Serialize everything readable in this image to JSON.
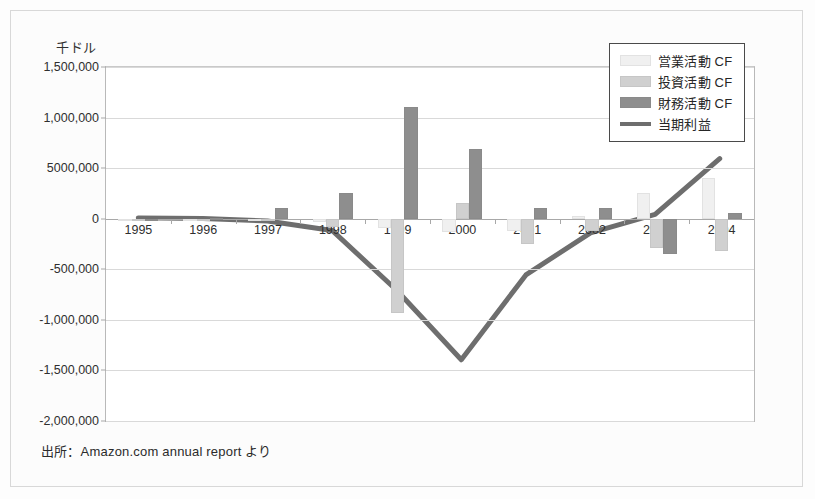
{
  "figure": {
    "unit_label": "千ドル",
    "source_note": "出所：Amazon.com annual report より"
  },
  "legend": {
    "items": [
      {
        "label": "営業活動 CF",
        "swatch": "op",
        "color": "#f0f0f0"
      },
      {
        "label": "投資活動 CF",
        "swatch": "inv",
        "color": "#d0d0d0"
      },
      {
        "label": "財務活動 CF",
        "swatch": "fin",
        "color": "#8e8e8e"
      },
      {
        "label": "当期利益",
        "swatch": "line",
        "color": "#6e6e6e"
      }
    ]
  },
  "chart_data": {
    "type": "bar",
    "title": "",
    "subtitle": "",
    "xlabel": "",
    "ylabel": "千ドル",
    "unit": "千ドル",
    "grid": true,
    "legend_position": "top-right",
    "categories": [
      "1995",
      "1996",
      "1997",
      "1998",
      "1999",
      "2000",
      "2001",
      "2002",
      "2003",
      "2004"
    ],
    "ylim": [
      -2000000,
      1500000
    ],
    "yticks": [
      1500000,
      1000000,
      500000,
      0,
      -500000,
      -1000000,
      -1500000,
      -2000000
    ],
    "ytick_labels": [
      "1,500,000",
      "1,000,000",
      "5000,000",
      "0",
      "-500,000",
      "-1,000,000",
      "-1,500,000",
      "-2,000,000"
    ],
    "series": [
      {
        "name": "営業活動 CF",
        "kind": "bar",
        "color": "#f0f0f0",
        "values": [
          0,
          -1000,
          -10000,
          -30000,
          -90000,
          -130000,
          -120000,
          30000,
          250000,
          400000
        ]
      },
      {
        "name": "投資活動 CF",
        "kind": "bar",
        "color": "#d0d0d0",
        "values": [
          0,
          -2000,
          -20000,
          -80000,
          -930000,
          160000,
          -250000,
          -120000,
          -290000,
          -320000
        ]
      },
      {
        "name": "財務活動 CF",
        "kind": "bar",
        "color": "#8e8e8e",
        "values": [
          0,
          5000,
          110000,
          250000,
          1100000,
          690000,
          110000,
          110000,
          -350000,
          60000
        ]
      },
      {
        "name": "当期利益",
        "kind": "line",
        "color": "#6e6e6e",
        "values": [
          -300,
          -5800,
          -31000,
          -125000,
          -720000,
          -1411000,
          -567000,
          -149000,
          35000,
          588000
        ]
      }
    ]
  }
}
